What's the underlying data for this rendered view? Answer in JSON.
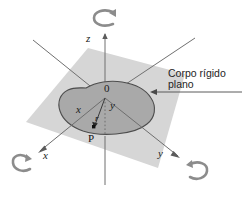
{
  "figure": {
    "background_color": "#ffffff",
    "plane": {
      "name": "coordinate-plane",
      "fill_color": "#d4d4d4",
      "description": "plano cinza claro (plano xy)"
    },
    "body": {
      "name": "rigid-body-blob",
      "fill_color": "#a8a8a8",
      "stroke_color": "#4a4a4a",
      "description": "corpo rígido plano de forma irregular"
    },
    "axes": [
      {
        "id": "z",
        "label": "z",
        "direction": "vertical-up",
        "has_arrow": true,
        "has_rotation_arrow": true,
        "color": "#6b6b6b"
      },
      {
        "id": "x",
        "label": "x",
        "direction": "lower-left",
        "has_arrow": true,
        "has_rotation_arrow": true,
        "color": "#6b6b6b"
      },
      {
        "id": "y",
        "label": "y",
        "direction": "lower-right",
        "has_arrow": true,
        "has_rotation_arrow": true,
        "color": "#6b6b6b"
      }
    ],
    "inner_axis_labels": {
      "x": "x",
      "y": "y",
      "z": "z"
    },
    "origin": {
      "label": "0",
      "name": "origin-marker"
    },
    "point": {
      "label": "P",
      "name": "point-p",
      "marker_color": "#101010"
    },
    "position_vector": {
      "label": "r",
      "name": "position-vector-r",
      "from": "origin",
      "to": "P"
    },
    "callout": {
      "line1": "Corpo rígido",
      "line2": "plano",
      "name": "rigid-body-callout",
      "leader_line": true
    }
  }
}
